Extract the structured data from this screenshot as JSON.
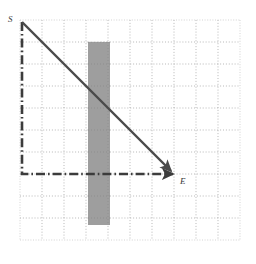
{
  "figure": {
    "name": "grid-path-diagram",
    "background_color": "#ffffff",
    "width": 256,
    "height": 264
  },
  "grid": {
    "origin_x": 20,
    "origin_y": 20,
    "cell_size": 22,
    "columns": 10,
    "rows": 10,
    "line_color": "#9a9a9a",
    "minor_line_color": "#c8c8c8",
    "style": "dotted"
  },
  "obstacle": {
    "label": "shaded-column",
    "fill_color": "#9e9e9e",
    "x": 88,
    "y": 42,
    "width": 22,
    "height": 183,
    "grid_column": 4,
    "grid_row_start": 1,
    "grid_row_end": 9
  },
  "points": [
    {
      "id": "start",
      "label": "S",
      "x": 22,
      "y": 22,
      "grid_col": 0,
      "grid_row": 0
    },
    {
      "id": "end",
      "label": "E",
      "x": 174,
      "y": 174,
      "grid_col": 7,
      "grid_row": 7
    }
  ],
  "paths": [
    {
      "id": "direct-path",
      "name": "diagonal-arrow",
      "style": "solid",
      "color": "#4a4a4a",
      "width": 2.4,
      "from": "S",
      "to": "E",
      "arrowhead": true,
      "points": "22,22 173,173"
    },
    {
      "id": "detour-path",
      "name": "dash-dot-arrow",
      "style": "dash-dot",
      "color": "#3c3c3c",
      "width": 2.6,
      "from": "S",
      "to": "E",
      "arrowhead": true,
      "points": "22,22 22,174 173,174"
    }
  ],
  "colors": {
    "stroke_dark": "#4a4a4a",
    "stroke_dashdot": "#3c3c3c",
    "obstacle_gray": "#9e9e9e",
    "grid_gray": "#9a9a9a",
    "grid_light": "#c9c9c9",
    "label_text": "#3a3a3a"
  }
}
